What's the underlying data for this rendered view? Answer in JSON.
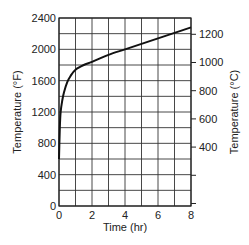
{
  "chart_data": {
    "type": "line",
    "title": "",
    "xlabel": "Time (hr)",
    "ylabel": "Temperature (°F)",
    "y2label": "Temperature (°C)",
    "xlim": [
      0,
      8
    ],
    "ylim": [
      0,
      2400
    ],
    "y2lim": [
      -17.8,
      1315.6
    ],
    "grid": true,
    "legend": "none",
    "x_ticks": [
      0,
      2,
      4,
      6,
      8
    ],
    "x_tick_labels": [
      "0",
      "2",
      "4",
      "6",
      "8"
    ],
    "y_ticks": [
      0,
      400,
      800,
      1200,
      1600,
      2000,
      2400
    ],
    "y_tick_labels": [
      "0",
      "400",
      "800",
      "1200",
      "1600",
      "2000",
      "2400"
    ],
    "y2_ticks": [
      400,
      600,
      800,
      1000,
      1200
    ],
    "y2_tick_labels": [
      "400",
      "600",
      "800",
      "1000",
      "1200"
    ],
    "series": [
      {
        "name": "Temperature",
        "x": [
          0,
          0.05,
          0.1,
          0.2,
          0.3,
          0.5,
          0.7,
          1.0,
          1.5,
          2.0,
          3.0,
          4.0,
          5.0,
          6.0,
          7.0,
          8.0
        ],
        "values": [
          600,
          1000,
          1200,
          1350,
          1450,
          1580,
          1660,
          1740,
          1800,
          1840,
          1930,
          2000,
          2070,
          2140,
          2210,
          2280
        ]
      }
    ],
    "line_color": "#111111",
    "grid_color": "#333333"
  }
}
